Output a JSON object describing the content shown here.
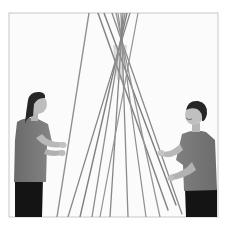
{
  "image": {
    "kind": "photograph",
    "tone": "grayscale",
    "caption": "Two children holding long bamboo poles leaned together to form a teepee frame",
    "frame": {
      "x": 9,
      "y": 13,
      "width": 209,
      "height": 204,
      "border_color": "#c8c8c8",
      "background": "#fbfbfb"
    },
    "subjects": [
      {
        "id": "girl",
        "position": "left",
        "description": "Girl with dark ponytail in a short-sleeved t-shirt and dark pants, looking up, gripping a pole with both hands"
      },
      {
        "id": "boy",
        "position": "right",
        "description": "Boy with short dark hair in a short-sleeved t-shirt and dark pants, smiling upward, holding the poles"
      }
    ],
    "object": {
      "name": "bamboo teepee poles",
      "count_approx": 12,
      "color": "#8a8a8a"
    },
    "palette": {
      "background": "#ffffff",
      "frame_fill": "#fbfbfb",
      "border": "#c8c8c8",
      "pole": "#8f8f8f",
      "pole_dark": "#6e6e6e",
      "shirt": "#7a7a7a",
      "shirt_shade": "#666666",
      "skin": "#b8b8b8",
      "hair": "#262626",
      "pants": "#141414"
    }
  }
}
